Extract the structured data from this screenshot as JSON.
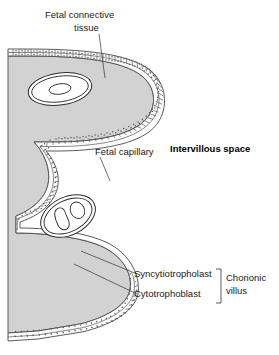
{
  "figure": {
    "title_alt": "Chorionic villus histology diagram",
    "background_color": "#ffffff",
    "stroma_fill": "#d2d2d2",
    "cell_fill": "#fdfdfd",
    "line_color": "#4a4a4a",
    "text_color": "#1a1a1a"
  },
  "labels": {
    "fetal_connective_tissue_line1": "Fetal connective",
    "fetal_connective_tissue_line2": "tissue",
    "fetal_capillary": "Fetal capillary",
    "intervillous_space": "Intervillous space",
    "syncytiotrophoblast": "Syncytiotropholast",
    "cytotrophoblast": "Cytotrophoblast",
    "chorionic_villus_line1": "Chorionic",
    "chorionic_villus_line2": "villus"
  },
  "structures": {
    "capillary_upper": "fetal-capillary-upper",
    "capillary_lower": "fetal-capillary-lower",
    "red_blood_cells_upper": 1,
    "red_blood_cells_lower": 2,
    "trophoblast_layers": 2
  }
}
